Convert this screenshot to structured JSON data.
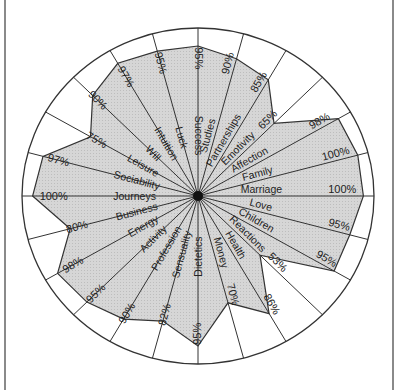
{
  "chart_data": {
    "type": "radar",
    "title": "",
    "center": [
      198,
      196
    ],
    "rx": 176,
    "ry": 168,
    "fill_color": "#cfcfcf",
    "stroke_color": "#333333",
    "categories": [
      "Success",
      "Studies",
      "Partnerships",
      "Emotivity",
      "Affection",
      "Family",
      "Marriage",
      "Love",
      "Children",
      "Reactions",
      "Health",
      "Money",
      "Dietetics",
      "Sensuality",
      "Profession",
      "Activity",
      "Energy",
      "Business",
      "Journeys",
      "Sociability",
      "Leisure",
      "Will",
      "Intuition",
      "Luck"
    ],
    "values": [
      95,
      90,
      85,
      65,
      98,
      100,
      100,
      95,
      95,
      53,
      86,
      70,
      95,
      82,
      90,
      95,
      98,
      80,
      100,
      97,
      75,
      90,
      97,
      95
    ],
    "value_labels": [
      "95%",
      "90%",
      "85%",
      "65%",
      "98%",
      "100%",
      "100%",
      "95%",
      "95%",
      "53%",
      "86%",
      "70%",
      "95%",
      "82%",
      "90%",
      "95%",
      "98%",
      "80%",
      "100%",
      "97%",
      "75%",
      "90%",
      "97%",
      "95%"
    ],
    "unit": "%",
    "range": [
      0,
      100
    ]
  }
}
